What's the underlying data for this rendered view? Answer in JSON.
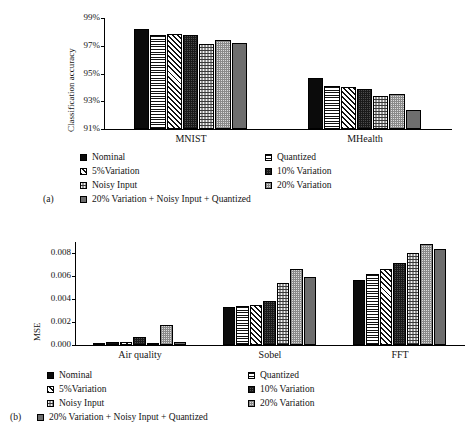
{
  "figure": {
    "panels": [
      {
        "tag": "(a)"
      },
      {
        "tag": "(b)"
      }
    ]
  },
  "legend": {
    "entries": [
      {
        "label": "Nominal",
        "pattern": "solid-black"
      },
      {
        "label": "Quantized",
        "pattern": "horizontal-lines"
      },
      {
        "label": "5%Variation",
        "pattern": "diagonal-stripes"
      },
      {
        "label": "10% Variation",
        "pattern": "dark-checker"
      },
      {
        "label": "Noisy Input",
        "pattern": "light-confetti"
      },
      {
        "label": "20% Variation",
        "pattern": "light-dots"
      },
      {
        "label": "20% Variation + Noisy Input + Quantized",
        "pattern": "solid-gray"
      }
    ]
  },
  "chart_data": [
    {
      "type": "bar",
      "panel": "(a)",
      "title": "",
      "xlabel": "",
      "ylabel": "Classification accuracy",
      "categories": [
        "MNIST",
        "MHealth"
      ],
      "ylim": [
        91,
        99
      ],
      "yticks": [
        "91%",
        "93%",
        "95%",
        "97%",
        "99%"
      ],
      "ytick_values": [
        91,
        93,
        95,
        97,
        99
      ],
      "grid": false,
      "legend_position": "below",
      "series": [
        {
          "name": "Nominal",
          "values": [
            98.2,
            94.7
          ]
        },
        {
          "name": "Quantized",
          "values": [
            97.75,
            94.1
          ]
        },
        {
          "name": "5%Variation",
          "values": [
            97.85,
            94.05
          ]
        },
        {
          "name": "10% Variation",
          "values": [
            97.8,
            93.9
          ]
        },
        {
          "name": "Noisy Input",
          "values": [
            97.15,
            93.35
          ]
        },
        {
          "name": "20% Variation",
          "values": [
            97.45,
            93.5
          ]
        },
        {
          "name": "20% Variation + Noisy Input + Quantized",
          "values": [
            97.2,
            92.4
          ]
        }
      ]
    },
    {
      "type": "bar",
      "panel": "(b)",
      "title": "",
      "xlabel": "",
      "ylabel": "MSE",
      "categories": [
        "Air quality",
        "Sobel",
        "FFT"
      ],
      "ylim": [
        0.0,
        0.009
      ],
      "yticks": [
        "0.000",
        "0.002",
        "0.004",
        "0.006",
        "0.008"
      ],
      "ytick_values": [
        0.0,
        0.002,
        0.004,
        0.006,
        0.008
      ],
      "grid": false,
      "legend_position": "below",
      "series": [
        {
          "name": "Nominal",
          "values": [
            0.0002,
            0.00335,
            0.00565
          ]
        },
        {
          "name": "Quantized",
          "values": [
            0.00025,
            0.00345,
            0.0062
          ]
        },
        {
          "name": "5%Variation",
          "values": [
            0.00022,
            0.0035,
            0.00665
          ]
        },
        {
          "name": "10% Variation",
          "values": [
            0.00072,
            0.00382,
            0.0072
          ]
        },
        {
          "name": "Noisy Input",
          "values": [
            0.00018,
            0.0054,
            0.008
          ]
        },
        {
          "name": "20% Variation",
          "values": [
            0.00178,
            0.0066,
            0.0088
          ]
        },
        {
          "name": "20% Variation + Noisy Input + Quantized",
          "values": [
            0.0003,
            0.00595,
            0.0084
          ]
        }
      ]
    }
  ]
}
